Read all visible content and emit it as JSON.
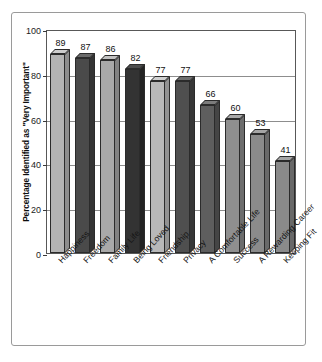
{
  "chart_data": {
    "type": "bar",
    "title": "",
    "subtitle": "",
    "xlabel": "",
    "ylabel": "Percentage Identified as \"Very Important\"",
    "ylim": [
      0,
      100
    ],
    "ytick_labels": [
      "100",
      "80",
      "60",
      "40",
      "20",
      "0"
    ],
    "ytick_values": [
      100,
      80,
      60,
      40,
      20,
      0
    ],
    "grid": true,
    "legend": "none",
    "orientation": "vertical",
    "style": "3d-shaded-bars",
    "categories": [
      "Happiness",
      "Freedom",
      "Family Life",
      "Being Loved",
      "Friendship",
      "Privacy",
      "A Comfortable Life",
      "Success",
      "A Rewarding Career",
      "Keeping Fit"
    ],
    "values": [
      89,
      87,
      86,
      82,
      77,
      77,
      66,
      60,
      53,
      41
    ],
    "value_labels": [
      "89",
      "87",
      "86",
      "82",
      "77",
      "77",
      "66",
      "60",
      "53",
      "41"
    ],
    "bar_colors": [
      "#b4b4b4",
      "#4a4a4a",
      "#a9a9a9",
      "#333333",
      "#b8b8b8",
      "#4f4f4f",
      "#5e5e5e",
      "#8f8f8f",
      "#8b8b8b",
      "#8a8a8a"
    ],
    "bar_side_colors": [
      "#8d8d8d",
      "#343434",
      "#828282",
      "#232323",
      "#919191",
      "#373737",
      "#454545",
      "#6d6d6d",
      "#696969",
      "#686868"
    ],
    "bar_top_colors": [
      "#cdcdcd",
      "#6a6a6a",
      "#c2c2c2",
      "#4c4c4c",
      "#d0d0d0",
      "#6f6f6f",
      "#7c7c7c",
      "#a8a8a8",
      "#a5a5a5",
      "#a4a4a4"
    ]
  },
  "colors": {
    "axis": "#585858",
    "grid": "#8d8d8d",
    "frame": "#9a9a9a",
    "text": "#111111",
    "background": "#ffffff"
  }
}
